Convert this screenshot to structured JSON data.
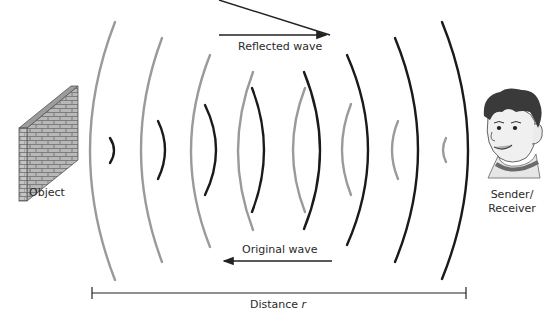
{
  "diagram": {
    "labels": {
      "reflected": "Reflected wave",
      "original": "Original wave",
      "object": "Object",
      "sender_line1": "Sender/",
      "sender_line2": "Receiver",
      "distance_prefix": "Distance ",
      "distance_var": "r"
    },
    "colors": {
      "original_wave": "#9a9a9a",
      "reflected_wave": "#1a1a1a",
      "text": "#2a2a2a",
      "brick": "#b8b8b8",
      "brick_mortar": "#6e6e6e"
    },
    "waves": {
      "original": [
        {
          "x": 115,
          "top": 22,
          "bottom": 280,
          "bulge": 90
        },
        {
          "x": 162,
          "top": 38,
          "bottom": 262,
          "bulge": 141
        },
        {
          "x": 210,
          "top": 55,
          "bottom": 247,
          "bulge": 191
        },
        {
          "x": 253,
          "top": 72,
          "bottom": 230,
          "bulge": 238
        },
        {
          "x": 305,
          "top": 88,
          "bottom": 212,
          "bulge": 293
        },
        {
          "x": 351,
          "top": 104,
          "bottom": 195,
          "bulge": 342
        },
        {
          "x": 398,
          "top": 121,
          "bottom": 179,
          "bulge": 392
        },
        {
          "x": 446,
          "top": 138,
          "bottom": 162,
          "bulge": 443
        }
      ],
      "reflected": [
        {
          "x": 110,
          "top": 138,
          "bottom": 163,
          "bulge": 114
        },
        {
          "x": 158,
          "top": 121,
          "bottom": 179,
          "bulge": 165
        },
        {
          "x": 205,
          "top": 105,
          "bottom": 195,
          "bulge": 216
        },
        {
          "x": 252,
          "top": 88,
          "bottom": 212,
          "bulge": 264
        },
        {
          "x": 304,
          "top": 72,
          "bottom": 229,
          "bulge": 320
        },
        {
          "x": 347,
          "top": 55,
          "bottom": 245,
          "bulge": 368
        },
        {
          "x": 395,
          "top": 38,
          "bottom": 262,
          "bulge": 418
        },
        {
          "x": 442,
          "top": 22,
          "bottom": 279,
          "bulge": 468
        }
      ]
    }
  }
}
